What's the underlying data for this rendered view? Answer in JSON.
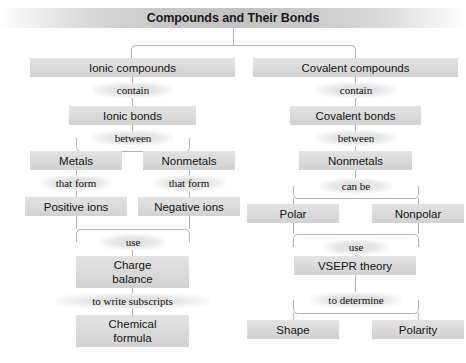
{
  "title": "Compounds and Their Bonds",
  "branches": {
    "ionic": {
      "root": "Ionic compounds",
      "link1": "contain",
      "bonds": "Ionic bonds",
      "link2": "between",
      "left_element": "Metals",
      "right_element": "Nonmetals",
      "left_link": "that form",
      "right_link": "that form",
      "left_ion": "Positive ions",
      "right_ion": "Negative ions",
      "link3": "use",
      "method": "Charge\nbalance",
      "link4": "to write subscripts",
      "result": "Chemical\nformula"
    },
    "covalent": {
      "root": "Covalent compounds",
      "link1": "contain",
      "bonds": "Covalent bonds",
      "link2": "between",
      "element": "Nonmetals",
      "link3": "can be",
      "left_type": "Polar",
      "right_type": "Nonpolar",
      "link4": "use",
      "method": "VSEPR theory",
      "link5": "to determine",
      "left_result": "Shape",
      "right_result": "Polarity"
    }
  },
  "colors": {
    "node_fill": "#dcdcdc",
    "line": "#b4b4b4",
    "text": "#141414",
    "banner_center": "#c2c2c2"
  }
}
